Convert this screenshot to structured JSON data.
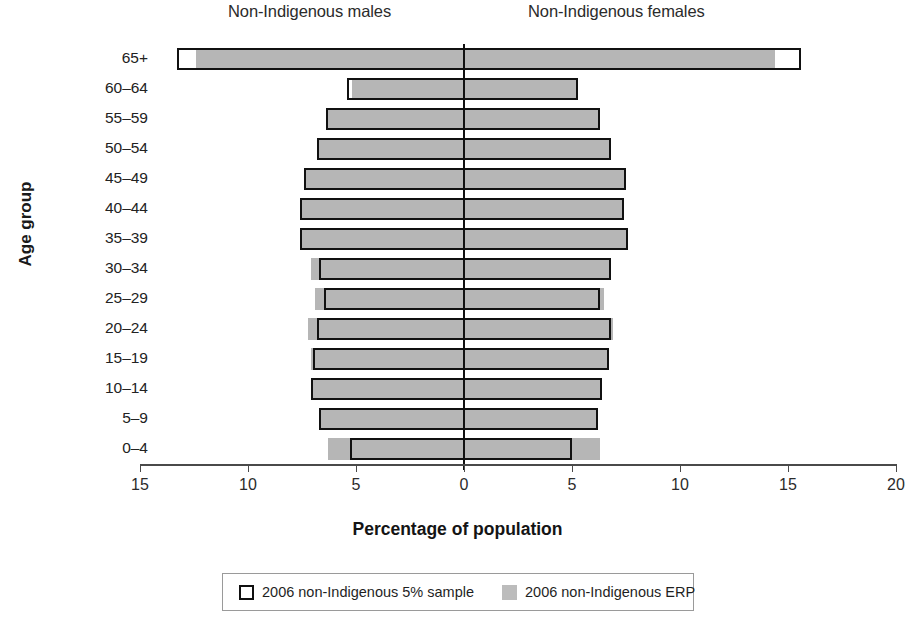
{
  "chart_data": {
    "type": "bar",
    "subtype": "population-pyramid",
    "title": "",
    "xlabel": "Percentage of population",
    "ylabel": "Age group",
    "panel_headers": {
      "left": "Non-Indigenous males",
      "right": "Non-Indigenous females"
    },
    "grid": false,
    "legend_position": "bottom",
    "xlim": [
      -15,
      20
    ],
    "xticks": [
      -15,
      -10,
      -5,
      0,
      5,
      10,
      15,
      20
    ],
    "xtick_labels": [
      "15",
      "10",
      "5",
      "0",
      "5",
      "10",
      "15",
      "20"
    ],
    "categories": [
      "65+",
      "60–64",
      "55–59",
      "50–54",
      "45–49",
      "40–44",
      "35–39",
      "30–34",
      "25–29",
      "20–24",
      "15–19",
      "10–14",
      "5–9",
      "0–4"
    ],
    "series": [
      {
        "name": "2006 non-Indigenous 5% sample",
        "style": "outline",
        "color": "#111111",
        "males": [
          13.3,
          5.4,
          6.4,
          6.8,
          7.4,
          7.6,
          7.6,
          6.7,
          6.5,
          6.8,
          7.0,
          7.1,
          6.7,
          5.3
        ],
        "females": [
          15.6,
          5.3,
          6.3,
          6.8,
          7.5,
          7.4,
          7.6,
          6.8,
          6.3,
          6.8,
          6.7,
          6.4,
          6.2,
          5.0
        ]
      },
      {
        "name": "2006 non-Indigenous ERP",
        "style": "fill",
        "color": "#b6b6b6",
        "males": [
          12.4,
          5.2,
          6.3,
          6.8,
          7.3,
          7.5,
          7.5,
          7.1,
          6.9,
          7.2,
          7.1,
          7.1,
          6.7,
          6.3
        ],
        "females": [
          14.4,
          5.2,
          6.2,
          6.7,
          7.4,
          7.3,
          7.5,
          6.8,
          6.5,
          6.9,
          6.7,
          6.4,
          6.2,
          6.3
        ]
      }
    ]
  },
  "legend": {
    "items": [
      {
        "label": "2006 non-Indigenous 5% sample",
        "swatch": "outline"
      },
      {
        "label": "2006 non-Indigenous ERP",
        "swatch": "fill"
      }
    ]
  },
  "colors": {
    "erp_fill": "#b6b6b6",
    "sample_outline": "#111111",
    "axis": "#4a4a4a"
  }
}
